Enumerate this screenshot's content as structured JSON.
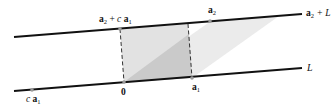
{
  "diagram": {
    "colors": {
      "line": "#111111",
      "shade_light": "#e6e6e6",
      "shade_rect": "#e3e3e3",
      "shade_overlap": "#c9c9c9",
      "point": "#9a9a9a",
      "dash": "#333333"
    },
    "lines": {
      "top": {
        "label_vec": "a",
        "label_sub": "2",
        "label_rest": " + L"
      },
      "bottom": {
        "label": "L"
      }
    },
    "points": {
      "origin": {
        "label": "0"
      },
      "a1": {
        "vec": "a",
        "sub": "1"
      },
      "a2": {
        "vec": "a",
        "sub": "2"
      },
      "a2_plus_c_a1": {
        "vec1": "a",
        "sub1": "2",
        "op": " + ",
        "scalar": "c",
        "vec2": "a",
        "sub2": "1"
      },
      "c_a1": {
        "scalar": "c",
        "vec": "a",
        "sub": "1"
      }
    }
  }
}
